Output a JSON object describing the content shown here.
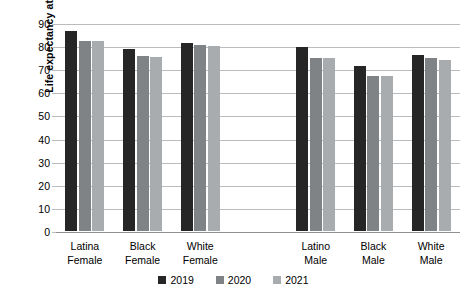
{
  "chart_data": {
    "type": "bar",
    "title": "",
    "xlabel": "",
    "ylabel": "Life expectancy at birth",
    "ylim": [
      0,
      90
    ],
    "ytick_step": 10,
    "yticks": [
      "90",
      "80",
      "70",
      "60",
      "50",
      "40",
      "30",
      "20",
      "10",
      "0"
    ],
    "grid": true,
    "legend_position": "bottom-center",
    "categories": [
      "Latina Female",
      "Black Female",
      "White Female",
      "Latino Male",
      "Black Male",
      "White Male"
    ],
    "category_lines": [
      [
        "Latina",
        "Female"
      ],
      [
        "Black",
        "Female"
      ],
      [
        "White",
        "Female"
      ],
      [
        "Latino",
        "Male"
      ],
      [
        "Black",
        "Male"
      ],
      [
        "White",
        "Male"
      ]
    ],
    "series": [
      {
        "name": "2019",
        "color": "#262626",
        "values": [
          86.6,
          78.8,
          81.4,
          79.6,
          71.4,
          76.2
        ]
      },
      {
        "name": "2020",
        "color": "#808385",
        "values": [
          82.3,
          75.8,
          80.5,
          74.9,
          67.1,
          74.9
        ]
      },
      {
        "name": "2021",
        "color": "#a9acae",
        "values": [
          82.3,
          75.4,
          80.0,
          74.7,
          67.1,
          74.0
        ]
      }
    ],
    "gap_after_category_index": 2
  },
  "legend": {
    "items": [
      {
        "label": "2019",
        "series_key": "s2019"
      },
      {
        "label": "2020",
        "series_key": "s2020"
      },
      {
        "label": "2021",
        "series_key": "s2021"
      }
    ]
  }
}
